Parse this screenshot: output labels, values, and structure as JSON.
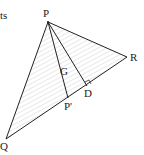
{
  "diagram": {
    "caption_fragment": "ts",
    "labels": {
      "P": "P",
      "Q": "Q",
      "R": "R",
      "G": "G",
      "D": "D",
      "Pprime": "P'"
    },
    "points": {
      "P": [
        48,
        22
      ],
      "Q": [
        6,
        139
      ],
      "R": [
        127,
        57
      ],
      "D": [
        87,
        86
      ],
      "Pprime": [
        68,
        98
      ]
    },
    "line_color": "#222222",
    "hatch_color": "#bbbbbb"
  }
}
